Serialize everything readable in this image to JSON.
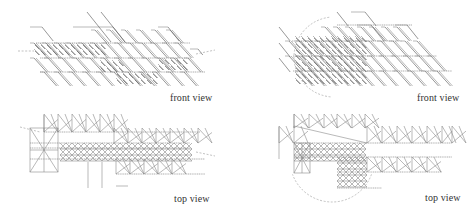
{
  "figure": {
    "panels": [
      {
        "id": "front-left",
        "caption": "front view",
        "box": {
          "x": 0,
          "y": 0,
          "w": 237,
          "h": 110
        },
        "caption_pos": {
          "x": 170,
          "y": 92
        },
        "h_rails": [
          {
            "y": 43,
            "x1": 36,
            "x2": 190
          },
          {
            "y": 58,
            "x1": 40,
            "x2": 190
          },
          {
            "y": 72,
            "x1": 40,
            "x2": 205
          }
        ],
        "hooks": [
          {
            "x": 30,
            "y": 27,
            "w": 12,
            "d": 14
          },
          {
            "x": 73,
            "y": 27,
            "w": 40,
            "d": 16
          },
          {
            "x": 158,
            "y": 27,
            "w": 10,
            "d": 14
          },
          {
            "x": 87,
            "y": 12,
            "w": 0,
            "d": 30
          },
          {
            "x": 101,
            "y": 12,
            "w": 0,
            "d": 30
          },
          {
            "x": 190,
            "y": 49,
            "w": 8,
            "d": 6
          }
        ],
        "diag_rows": [
          {
            "y0": 30,
            "y1": 43,
            "xs": [
              95,
              110,
              125,
              140,
              155,
              170
            ]
          },
          {
            "y0": 43,
            "y1": 58,
            "xs": [
              34,
              46,
              58,
              70,
              82,
              94,
              106,
              118,
              130,
              142,
              154,
              166,
              178
            ]
          },
          {
            "y0": 58,
            "y1": 72,
            "xs": [
              34,
              48,
              62,
              76,
              90,
              104,
              118,
              132,
              146,
              160,
              174,
              188
            ]
          },
          {
            "y0": 72,
            "y1": 86,
            "xs": [
              44,
              58,
              72,
              86,
              100,
              114,
              128,
              142,
              156,
              170,
              184
            ]
          }
        ],
        "dense_regions": [
          {
            "x": 34,
            "y": 43,
            "w": 70,
            "h": 12
          },
          {
            "x": 100,
            "y": 60,
            "w": 20,
            "h": 10
          },
          {
            "x": 158,
            "y": 58,
            "w": 28,
            "h": 12
          },
          {
            "x": 116,
            "y": 72,
            "w": 40,
            "h": 10
          }
        ],
        "dashes": [
          {
            "x1": 18,
            "y1": 51,
            "x2": 34,
            "y2": 51
          },
          {
            "x1": 196,
            "y1": 54,
            "x2": 215,
            "y2": 50
          }
        ],
        "arc": null
      },
      {
        "id": "front-right",
        "caption": "front view",
        "box": {
          "x": 237,
          "y": 0,
          "w": 237,
          "h": 110
        },
        "caption_pos": {
          "x": 180,
          "y": 92
        },
        "h_rails": [
          {
            "y": 25,
            "x1": 100,
            "x2": 175
          },
          {
            "y": 41,
            "x1": 55,
            "x2": 165
          },
          {
            "y": 56,
            "x1": 56,
            "x2": 200
          },
          {
            "y": 71,
            "x1": 56,
            "x2": 215
          }
        ],
        "hooks": [
          {
            "x": 114,
            "y": 12,
            "w": 14,
            "d": 14
          },
          {
            "x": 120,
            "y": 25,
            "w": 14,
            "d": 16
          },
          {
            "x": 158,
            "y": 25,
            "w": 12,
            "d": 14
          },
          {
            "x": 100,
            "y": 12,
            "w": 0,
            "d": 14
          },
          {
            "x": 42,
            "y": 27,
            "w": 0,
            "d": 14
          },
          {
            "x": 42,
            "y": 43,
            "w": 0,
            "d": 14
          },
          {
            "x": 42,
            "y": 58,
            "w": 0,
            "d": 14
          }
        ],
        "diag_rows": [
          {
            "y0": 27,
            "y1": 41,
            "xs": [
              88,
              100,
              112,
              124,
              136,
              148,
              160
            ]
          },
          {
            "y0": 41,
            "y1": 56,
            "xs": [
              52,
              62,
              72,
              82,
              92,
              102,
              112,
              122,
              132,
              144,
              156,
              168,
              180
            ]
          },
          {
            "y0": 56,
            "y1": 71,
            "xs": [
              52,
              62,
              72,
              82,
              92,
              102,
              112,
              122,
              134,
              146,
              158,
              170,
              182,
              194
            ]
          },
          {
            "y0": 71,
            "y1": 86,
            "xs": [
              62,
              74,
              86,
              98,
              110,
              122,
              134,
              146,
              160,
              174,
              188,
              200
            ]
          }
        ],
        "dense_regions": [
          {
            "x": 58,
            "y": 36,
            "w": 70,
            "h": 44
          }
        ],
        "dashes": [],
        "arc": {
          "cx": 97,
          "cy": 57,
          "r": 40,
          "start": 200,
          "end": 340,
          "side": "left"
        }
      },
      {
        "id": "top-left",
        "caption": "top view",
        "box": {
          "x": 0,
          "y": 110,
          "w": 237,
          "h": 109
        },
        "caption_pos": {
          "x": 174,
          "y": 83
        },
        "h_rails": [
          {
            "y": 22,
            "x1": 44,
            "x2": 200
          },
          {
            "y": 33,
            "x1": 30,
            "x2": 190
          },
          {
            "y": 38,
            "x1": 30,
            "x2": 190
          },
          {
            "y": 49,
            "x1": 30,
            "x2": 205
          },
          {
            "y": 64,
            "x1": 116,
            "x2": 205
          }
        ],
        "hooks": [
          {
            "x": 44,
            "y": 5,
            "w": 0,
            "d": 17
          },
          {
            "x": 88,
            "y": 52,
            "w": 0,
            "d": 26
          },
          {
            "x": 102,
            "y": 52,
            "w": 0,
            "d": 26
          },
          {
            "x": 116,
            "y": 76,
            "w": 12,
            "d": 0
          }
        ],
        "zigzag_top": {
          "y0": 22,
          "y1": 4,
          "xs": [
            44,
            58,
            72,
            86,
            100,
            114
          ]
        },
        "zigzag_upper": {
          "y0": 33,
          "y1": 18,
          "xs": [
            114,
            128,
            142,
            156,
            170,
            184,
            198
          ]
        },
        "zigzag_lower": {
          "y0": 64,
          "y1": 49,
          "xs": [
            116,
            130,
            144,
            158,
            172
          ]
        },
        "left_cluster": {
          "x": 30,
          "y": 18,
          "w": 28,
          "h": 44
        },
        "dense_regions": [
          {
            "x": 60,
            "y": 33,
            "w": 130,
            "h": 16
          }
        ],
        "dashes": [
          {
            "x1": 20,
            "y1": 17,
            "x2": 40,
            "y2": 22
          },
          {
            "x1": 196,
            "y1": 42,
            "x2": 215,
            "y2": 46
          }
        ],
        "arc": null
      },
      {
        "id": "top-right",
        "caption": "top view",
        "box": {
          "x": 237,
          "y": 110,
          "w": 237,
          "h": 109
        },
        "caption_pos": {
          "x": 188,
          "y": 82
        },
        "h_rails": [
          {
            "y": 33,
            "x1": 57,
            "x2": 215
          },
          {
            "y": 47,
            "x1": 57,
            "x2": 215
          },
          {
            "y": 62,
            "x1": 100,
            "x2": 205
          },
          {
            "y": 78,
            "x1": 100,
            "x2": 145
          }
        ],
        "hooks": [
          {
            "x": 57,
            "y": 4,
            "w": 0,
            "d": 14
          },
          {
            "x": 42,
            "y": 17,
            "w": 0,
            "d": 32
          }
        ],
        "zigzag_top": {
          "y0": 18,
          "y1": 4,
          "xs": [
            57,
            72,
            87,
            100,
            115,
            128
          ]
        },
        "zigzag_upper": {
          "y0": 33,
          "y1": 16,
          "xs": [
            42,
            57,
            130,
            145,
            160,
            175,
            190,
            205,
            215
          ]
        },
        "zigzag_lower": {
          "y0": 62,
          "y1": 47,
          "xs": [
            130,
            145,
            160,
            175,
            190
          ]
        },
        "left_cluster": {
          "x": 57,
          "y": 33,
          "w": 16,
          "h": 30
        },
        "dense_regions": [
          {
            "x": 57,
            "y": 33,
            "w": 70,
            "h": 14
          },
          {
            "x": 100,
            "y": 47,
            "w": 30,
            "h": 30
          }
        ],
        "dashes": [],
        "arc": {
          "cx": 95,
          "cy": 50,
          "r": 42,
          "start": 20,
          "end": 160,
          "side": "bottom"
        }
      }
    ]
  }
}
